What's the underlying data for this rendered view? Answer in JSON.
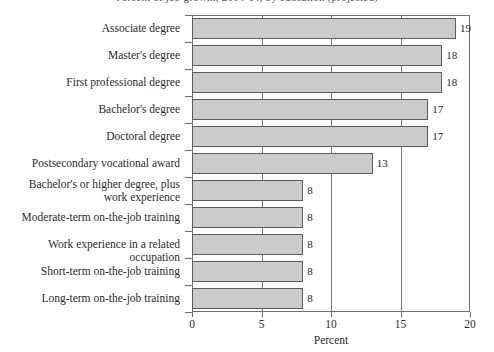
{
  "chart_data": {
    "type": "bar",
    "orientation": "horizontal",
    "title": "Percent of job growth, 2004-14, by education (projected)",
    "title_clipped": true,
    "xlabel": "Percent",
    "ylabel": "",
    "xlim": [
      0,
      20
    ],
    "xticks": [
      0,
      5,
      10,
      15,
      20
    ],
    "xticklabels": [
      "0",
      "5",
      "10",
      "15",
      "20"
    ],
    "grid": "vertical",
    "legend": "none",
    "bar_color": "#cbcbcb",
    "bar_edge_color": "#5b5b5b",
    "categories": [
      "Associate degree",
      "Master's degree",
      "First professional degree",
      "Bachelor's degree",
      "Doctoral degree",
      "Postsecondary vocational award",
      "Bachelor's or higher degree, plus\nwork experience",
      "Moderate-term on-the-job training",
      "Work experience in a related occupation",
      "Short-term on-the-job training",
      "Long-term on-the-job training"
    ],
    "values": [
      19,
      18,
      18,
      17,
      17,
      13,
      8,
      8,
      8,
      8,
      8
    ],
    "value_labels": [
      "19",
      "18",
      "18",
      "17",
      "17",
      "13",
      "8",
      "8",
      "8",
      "8",
      "8"
    ]
  }
}
